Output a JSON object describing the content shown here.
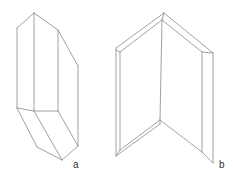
{
  "figures": [
    {
      "id": "a",
      "label": "a",
      "description": "crystal prism",
      "label_pos": [
        73,
        160
      ],
      "edges": [
        [
          17,
          28,
          34,
          13
        ],
        [
          34,
          13,
          58,
          30
        ],
        [
          58,
          30,
          78,
          66
        ],
        [
          17,
          28,
          17,
          108
        ],
        [
          34,
          13,
          34,
          111
        ],
        [
          58,
          30,
          58,
          111
        ],
        [
          78,
          66,
          78,
          146
        ],
        [
          17,
          108,
          34,
          111
        ],
        [
          34,
          111,
          58,
          111
        ],
        [
          58,
          111,
          78,
          146
        ],
        [
          17,
          108,
          37,
          147
        ],
        [
          34,
          111,
          62,
          160
        ],
        [
          37,
          147,
          62,
          160
        ],
        [
          62,
          160,
          78,
          146
        ]
      ]
    },
    {
      "id": "b",
      "label": "b",
      "description": "folded panel / open book",
      "label_pos": [
        219,
        160
      ],
      "edges": [
        [
          116,
          48,
          164,
          13
        ],
        [
          120,
          52,
          162,
          20
        ],
        [
          116,
          50,
          120,
          52
        ],
        [
          164,
          13,
          162,
          20
        ],
        [
          164,
          13,
          213,
          53
        ],
        [
          162,
          20,
          202,
          52
        ],
        [
          202,
          52,
          213,
          53
        ],
        [
          116,
          48,
          116,
          156
        ],
        [
          120,
          52,
          120,
          150
        ],
        [
          162,
          20,
          160,
          120
        ],
        [
          202,
          52,
          202,
          152
        ],
        [
          213,
          53,
          213,
          163
        ],
        [
          116,
          156,
          160,
          124
        ],
        [
          120,
          150,
          160,
          120
        ],
        [
          116,
          156,
          120,
          150
        ],
        [
          160,
          120,
          202,
          152
        ],
        [
          160,
          124,
          160,
          120
        ],
        [
          202,
          152,
          213,
          163
        ]
      ]
    }
  ]
}
